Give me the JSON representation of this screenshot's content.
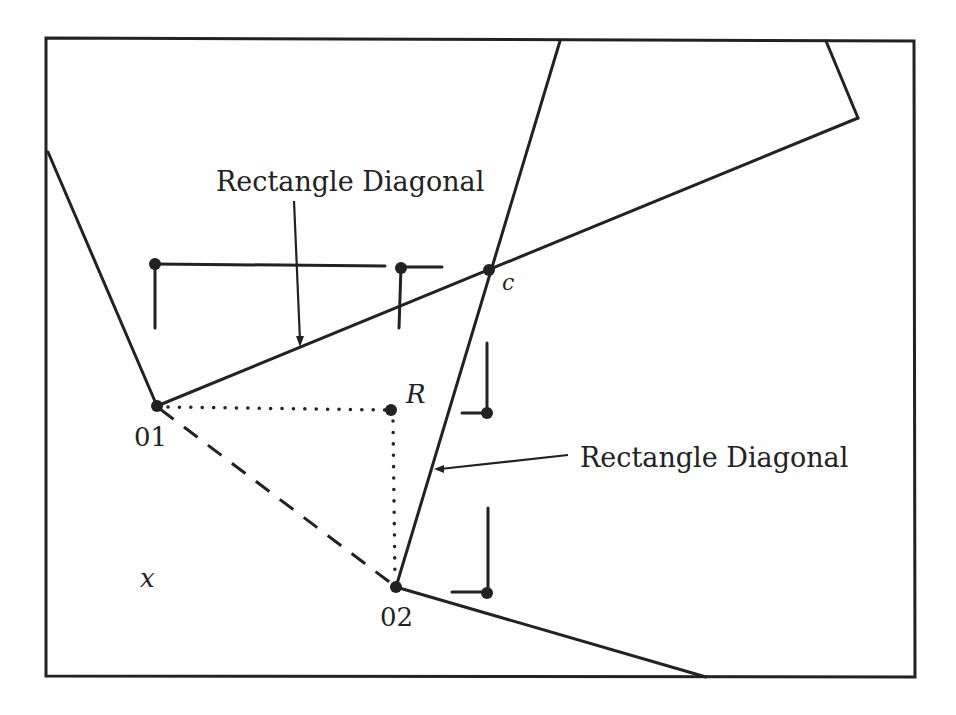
{
  "diagram": {
    "stroke_color": "#222222",
    "background": "#ffffff",
    "labels": {
      "diagonal_top": "Rectangle Diagonal",
      "diagonal_right": "Rectangle Diagonal",
      "point_c": "c",
      "point_r": "R",
      "point_o1": "01",
      "point_o2": "02",
      "point_x": "x"
    },
    "points": {
      "O1": [
        157,
        406
      ],
      "O2": [
        396,
        587
      ],
      "R": [
        391,
        410
      ],
      "c": [
        489,
        270
      ]
    },
    "frame": {
      "x": 46,
      "y": 39,
      "width": 869,
      "height": 638
    }
  }
}
